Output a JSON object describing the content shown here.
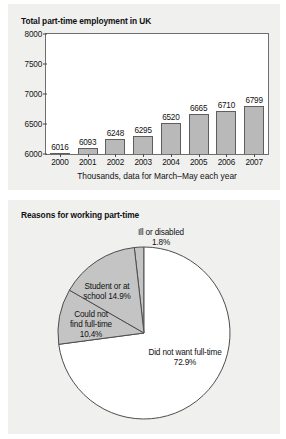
{
  "figures": {
    "bar": {
      "title": "Total part-time employment in UK",
      "xlabel": "Thousands, data for March–May each year"
    },
    "pie": {
      "title": "Reasons for working part-time"
    }
  },
  "chart_data": [
    {
      "type": "bar",
      "title": "Total part-time employment in UK",
      "xlabel": "Thousands, data for March–May each year",
      "ylabel": "",
      "categories": [
        "2000",
        "2001",
        "2002",
        "2003",
        "2004",
        "2005",
        "2006",
        "2007"
      ],
      "values": [
        6016,
        6093,
        6248,
        6295,
        6520,
        6665,
        6710,
        6799
      ],
      "value_labels": [
        "6016",
        "6093",
        "6248",
        "6295",
        "6520",
        "6665",
        "6710",
        "6799"
      ],
      "ylim": [
        6000,
        8000
      ],
      "yticks": [
        6000,
        6500,
        7000,
        7500,
        8000
      ],
      "ytick_labels": [
        "6000",
        "6500",
        "7000",
        "7500",
        "8000"
      ],
      "grid": false,
      "legend": "none",
      "bar_fill": "#b9b9b9",
      "bar_stroke": "#5e5e5e",
      "plot_background": "#ffffff"
    },
    {
      "type": "pie",
      "title": "Reasons for working part-time",
      "labels": [
        "Ill or disabled",
        "Did not want full-time",
        "Could not find full-time",
        "Student or at school"
      ],
      "values": [
        1.8,
        72.9,
        10.4,
        14.9
      ],
      "value_labels": [
        "1.8%",
        "72.9%",
        "10.4%",
        "14.9%"
      ],
      "slice_label_lines": [
        [
          "Ill or disabled",
          "1.8%"
        ],
        [
          "Did not want full-time",
          "72.9%"
        ],
        [
          "Could not",
          "find full-time",
          "10.4%"
        ],
        [
          "Student or at",
          "school 14.9%"
        ]
      ],
      "colors": [
        "#c4c4c4",
        "#ffffff",
        "#c4c4c4",
        "#c4c4c4"
      ],
      "stroke": "#4d4d4d",
      "legend": "none"
    }
  ],
  "colors": {
    "page_background": "#ffffff",
    "panel_background": "#f0f0ef",
    "text": "#111111",
    "gray_fill": "#c4c4c4",
    "bar_fill": "#b9b9b9",
    "outline": "#5e5e5e"
  }
}
